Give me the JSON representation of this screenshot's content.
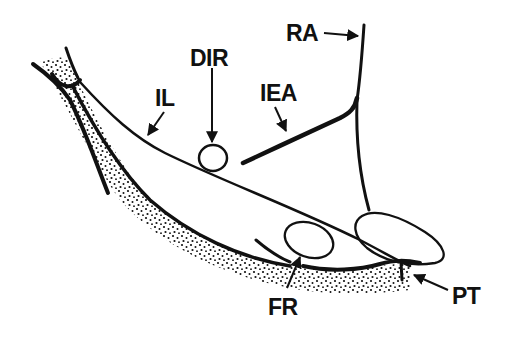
{
  "diagram": {
    "type": "anatomical-line-drawing",
    "colors": {
      "ink": "#111111",
      "background": "#ffffff"
    },
    "labels": [
      {
        "id": "ra",
        "text": "RA",
        "x": 286,
        "y": 22
      },
      {
        "id": "dir",
        "text": "DIR",
        "x": 190,
        "y": 47
      },
      {
        "id": "iea",
        "text": "IEA",
        "x": 260,
        "y": 82
      },
      {
        "id": "il",
        "text": "IL",
        "x": 155,
        "y": 87
      },
      {
        "id": "fr",
        "text": "FR",
        "x": 268,
        "y": 296
      },
      {
        "id": "pt",
        "text": "PT",
        "x": 452,
        "y": 285
      }
    ]
  }
}
